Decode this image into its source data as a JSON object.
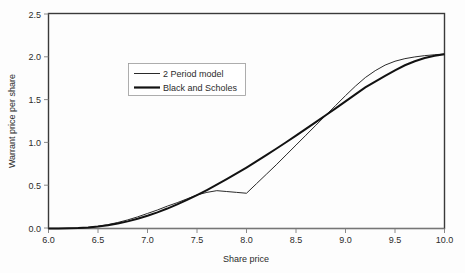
{
  "chart_data": {
    "type": "line",
    "title": "",
    "xlabel": "Share price",
    "ylabel": "Warrant price per share",
    "xlim": [
      6.0,
      10.0
    ],
    "ylim": [
      0.0,
      2.5
    ],
    "grid": false,
    "legend_position": "upper-left-inside",
    "xticks": [
      "6.0",
      "6.5",
      "7.0",
      "7.5",
      "8.0",
      "8.5",
      "9.0",
      "9.5",
      "10.0"
    ],
    "xtick_values": [
      6.0,
      6.5,
      7.0,
      7.5,
      8.0,
      8.5,
      9.0,
      9.5,
      10.0
    ],
    "yticks": [
      "0.0",
      "0.5",
      "1.0",
      "1.5",
      "2.0",
      "2.5"
    ],
    "ytick_values": [
      0.0,
      0.5,
      1.0,
      1.5,
      2.0,
      2.5
    ],
    "x": [
      6.0,
      6.1,
      6.2,
      6.3,
      6.4,
      6.5,
      6.6,
      6.7,
      6.8,
      6.9,
      7.0,
      7.1,
      7.2,
      7.3,
      7.4,
      7.5,
      7.6,
      7.7,
      7.8,
      7.9,
      8.0,
      8.1,
      8.2,
      8.3,
      8.4,
      8.5,
      8.6,
      8.7,
      8.8,
      8.9,
      9.0,
      9.1,
      9.2,
      9.3,
      9.4,
      9.5,
      9.6,
      9.7,
      9.8,
      9.9,
      10.0
    ],
    "series": [
      {
        "name": "2 Period model",
        "line_style": "thin",
        "color": "#2a2a2a",
        "values": [
          0.0,
          0.0,
          0.0,
          0.005,
          0.012,
          0.025,
          0.045,
          0.07,
          0.1,
          0.135,
          0.175,
          0.215,
          0.26,
          0.3,
          0.345,
          0.39,
          0.42,
          0.44,
          0.43,
          0.42,
          0.41,
          0.52,
          0.63,
          0.74,
          0.855,
          0.97,
          1.085,
          1.2,
          1.315,
          1.43,
          1.545,
          1.655,
          1.755,
          1.835,
          1.9,
          1.945,
          1.975,
          1.995,
          2.01,
          2.02,
          2.03
        ]
      },
      {
        "name": "Black and Scholes",
        "line_style": "thick",
        "color": "#121212",
        "values": [
          0.0,
          0.0,
          0.002,
          0.006,
          0.013,
          0.023,
          0.038,
          0.058,
          0.083,
          0.113,
          0.148,
          0.188,
          0.232,
          0.28,
          0.332,
          0.388,
          0.447,
          0.509,
          0.573,
          0.64,
          0.709,
          0.78,
          0.853,
          0.927,
          1.003,
          1.08,
          1.158,
          1.237,
          1.317,
          1.397,
          1.478,
          1.559,
          1.64,
          1.708,
          1.775,
          1.84,
          1.898,
          1.945,
          1.982,
          2.008,
          2.025
        ]
      }
    ],
    "legend": [
      "2 Period model",
      "Black and Scholes"
    ]
  }
}
